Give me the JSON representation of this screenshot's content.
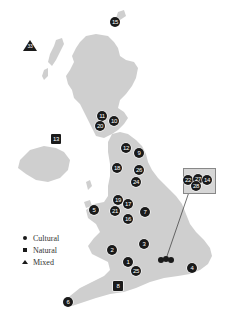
{
  "map": {
    "land_color": "#cfcfcf",
    "marker_color": "#1a1a1a",
    "inset_connector": {
      "from": [
        189,
        191
      ],
      "to": [
        166,
        259
      ]
    }
  },
  "legend": {
    "items": [
      {
        "symbol": "circle",
        "label": "Cultural"
      },
      {
        "symbol": "square",
        "label": "Natural"
      },
      {
        "symbol": "triangle",
        "label": "Mixed"
      }
    ]
  },
  "markers": [
    {
      "id": "15",
      "type": "cultural",
      "x": 115,
      "y": 22
    },
    {
      "id": "33",
      "type": "mixed",
      "x": 30,
      "y": 46
    },
    {
      "id": "11",
      "type": "cultural",
      "x": 102,
      "y": 116
    },
    {
      "id": "10",
      "type": "cultural",
      "x": 114,
      "y": 121
    },
    {
      "id": "20",
      "type": "cultural",
      "x": 100,
      "y": 126
    },
    {
      "id": "13",
      "type": "natural",
      "x": 56,
      "y": 139
    },
    {
      "id": "12",
      "type": "cultural",
      "x": 126,
      "y": 148
    },
    {
      "id": "9",
      "type": "cultural",
      "x": 139,
      "y": 153
    },
    {
      "id": "18",
      "type": "cultural",
      "x": 117,
      "y": 168
    },
    {
      "id": "26",
      "type": "cultural",
      "x": 139,
      "y": 170
    },
    {
      "id": "24",
      "type": "cultural",
      "x": 136,
      "y": 182
    },
    {
      "id": "19",
      "type": "cultural",
      "x": 118,
      "y": 200
    },
    {
      "id": "17",
      "type": "cultural",
      "x": 128,
      "y": 204
    },
    {
      "id": "5",
      "type": "cultural",
      "x": 94,
      "y": 210
    },
    {
      "id": "21",
      "type": "cultural",
      "x": 115,
      "y": 211
    },
    {
      "id": "7",
      "type": "cultural",
      "x": 145,
      "y": 212
    },
    {
      "id": "16",
      "type": "cultural",
      "x": 128,
      "y": 219
    },
    {
      "id": "3",
      "type": "cultural",
      "x": 144,
      "y": 244
    },
    {
      "id": "2",
      "type": "cultural",
      "x": 112,
      "y": 250
    },
    {
      "id": "1",
      "type": "cultural",
      "x": 128,
      "y": 262
    },
    {
      "id": "25",
      "type": "cultural",
      "x": 136,
      "y": 271
    },
    {
      "id": "4",
      "type": "cultural",
      "x": 192,
      "y": 268
    },
    {
      "id": "8",
      "type": "natural",
      "x": 118,
      "y": 286
    },
    {
      "id": "6",
      "type": "cultural",
      "x": 68,
      "y": 302
    },
    {
      "id": "22",
      "type": "cultural",
      "x": 188,
      "y": 180
    },
    {
      "id": "27",
      "type": "cultural",
      "x": 198,
      "y": 179
    },
    {
      "id": "14",
      "type": "cultural",
      "x": 207,
      "y": 180
    },
    {
      "id": "28",
      "type": "cultural",
      "x": 196,
      "y": 186
    }
  ],
  "london_cluster": {
    "x": 166,
    "y": 260
  }
}
